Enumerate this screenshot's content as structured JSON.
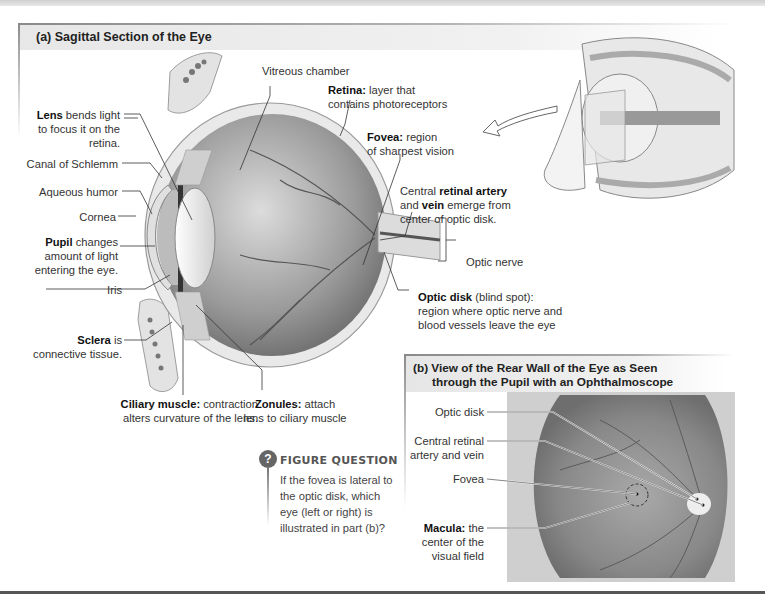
{
  "panel_a": {
    "title": "(a) Sagittal Section of the Eye",
    "labels": {
      "vitreous": "Vitreous chamber",
      "retina_bold": "Retina:",
      "retina_1": " layer that",
      "retina_2": "contains photoreceptors",
      "fovea_bold": "Fovea:",
      "fovea_1": " region",
      "fovea_2": "of sharpest vision",
      "lens_bold": "Lens",
      "lens_1": " bends light",
      "lens_2": "to focus it on the",
      "lens_3": "retina.",
      "canal": "Canal of Schlemm",
      "aqueous": "Aqueous humor",
      "cornea": "Cornea",
      "pupil_bold": "Pupil",
      "pupil_1": " changes",
      "pupil_2": "amount of light",
      "pupil_3": "entering the eye.",
      "iris": "Iris",
      "sclera_bold": "Sclera",
      "sclera_1": " is",
      "sclera_2": "connective tissue.",
      "ciliary_bold": "Ciliary muscle:",
      "ciliary_1": " contraction",
      "ciliary_2": "alters curvature of the lens.",
      "zonules_bold": "Zonules:",
      "zonules_1": " attach",
      "zonules_2": "lens to ciliary muscle",
      "artery_1": "Central ",
      "artery_bold1": "retinal artery",
      "artery_2": "and ",
      "artery_bold2": "vein",
      "artery_3": " emerge from",
      "artery_4": "center of optic disk.",
      "optic_nerve": "Optic nerve",
      "optic_disk_bold": "Optic disk",
      "optic_disk_1": " (blind spot):",
      "optic_disk_2": "region where optic nerve and",
      "optic_disk_3": "blood vessels leave the eye"
    }
  },
  "panel_b": {
    "title_line1": "(b) View of the Rear Wall of the Eye as Seen",
    "title_line2": "through the Pupil with an Ophthalmoscope",
    "labels": {
      "optic_disk": "Optic disk",
      "artery_1": "Central retinal",
      "artery_2": "artery and vein",
      "fovea": "Fovea",
      "macula_bold": "Macula:",
      "macula_1": " the",
      "macula_2": "center of the",
      "macula_3": "visual field"
    }
  },
  "figure_question": {
    "icon": "?",
    "title": "FIGURE QUESTION",
    "lines": [
      "If the fovea is lateral to",
      "the optic disk, which",
      "eye (left or right) is",
      "illustrated in part (b)?"
    ]
  },
  "colors": {
    "frame": "#8a8a8a",
    "title_bg": "#e7e7e7",
    "text": "#333333",
    "rule": "#555555"
  }
}
